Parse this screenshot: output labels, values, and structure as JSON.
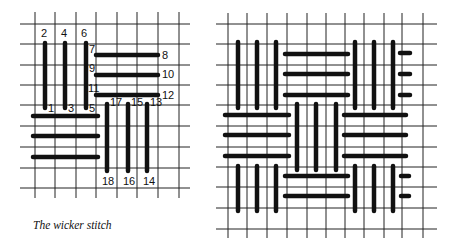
{
  "caption": "The wicker stitch",
  "left_figure": {
    "title": "stitch-order-diagram",
    "grid": {
      "x": [
        35,
        55,
        76,
        96,
        117,
        137,
        158,
        179
      ],
      "y": [
        24,
        44,
        65,
        85,
        105,
        126,
        147,
        168,
        188
      ],
      "x_extent": [
        20,
        190
      ],
      "y_extent": [
        12,
        198
      ]
    },
    "stitches": [
      {
        "x1": 45,
        "y1": 43,
        "x2": 45,
        "y2": 108
      },
      {
        "x1": 65,
        "y1": 43,
        "x2": 65,
        "y2": 108
      },
      {
        "x1": 86,
        "y1": 43,
        "x2": 86,
        "y2": 108
      },
      {
        "x1": 96,
        "y1": 55,
        "x2": 158,
        "y2": 55
      },
      {
        "x1": 96,
        "y1": 75,
        "x2": 158,
        "y2": 75
      },
      {
        "x1": 96,
        "y1": 95,
        "x2": 158,
        "y2": 95
      },
      {
        "x1": 33,
        "y1": 116,
        "x2": 98,
        "y2": 116
      },
      {
        "x1": 33,
        "y1": 136,
        "x2": 98,
        "y2": 136
      },
      {
        "x1": 33,
        "y1": 157,
        "x2": 98,
        "y2": 157
      },
      {
        "x1": 107,
        "y1": 104,
        "x2": 107,
        "y2": 171
      },
      {
        "x1": 128,
        "y1": 104,
        "x2": 128,
        "y2": 171
      },
      {
        "x1": 147,
        "y1": 104,
        "x2": 147,
        "y2": 171
      }
    ],
    "labels": [
      {
        "text": "2",
        "x": 41,
        "y": 37
      },
      {
        "text": "4",
        "x": 61,
        "y": 37
      },
      {
        "text": "6",
        "x": 81,
        "y": 37
      },
      {
        "text": "7",
        "x": 89,
        "y": 53
      },
      {
        "text": "8",
        "x": 162,
        "y": 59
      },
      {
        "text": "9",
        "x": 89,
        "y": 72
      },
      {
        "text": "10",
        "x": 162,
        "y": 78
      },
      {
        "text": "11",
        "x": 88,
        "y": 92
      },
      {
        "text": "12",
        "x": 162,
        "y": 99
      },
      {
        "text": "1",
        "x": 48,
        "y": 112
      },
      {
        "text": "3",
        "x": 68,
        "y": 112
      },
      {
        "text": "5",
        "x": 89,
        "y": 112
      },
      {
        "text": "17",
        "x": 110,
        "y": 106
      },
      {
        "text": "15",
        "x": 131,
        "y": 106
      },
      {
        "text": "13",
        "x": 150,
        "y": 106
      },
      {
        "text": "18",
        "x": 102,
        "y": 185
      },
      {
        "text": "16",
        "x": 123,
        "y": 185
      },
      {
        "text": "14",
        "x": 143,
        "y": 185
      }
    ]
  },
  "right_figure": {
    "title": "wicker-pattern-diagram",
    "grid": {
      "x": [
        228,
        247,
        267,
        287,
        307,
        326,
        345,
        364,
        384,
        402,
        423
      ],
      "y": [
        24,
        44,
        65,
        85,
        105,
        126,
        147,
        167,
        187,
        208,
        229
      ],
      "x_extent": [
        216,
        437
      ],
      "y_extent": [
        13,
        238
      ]
    },
    "stitches": [
      {
        "x1": 238,
        "y1": 42,
        "x2": 238,
        "y2": 108
      },
      {
        "x1": 257,
        "y1": 42,
        "x2": 257,
        "y2": 108
      },
      {
        "x1": 276,
        "y1": 42,
        "x2": 276,
        "y2": 108
      },
      {
        "x1": 285,
        "y1": 54,
        "x2": 348,
        "y2": 54
      },
      {
        "x1": 285,
        "y1": 74,
        "x2": 348,
        "y2": 74
      },
      {
        "x1": 285,
        "y1": 95,
        "x2": 348,
        "y2": 95
      },
      {
        "x1": 355,
        "y1": 42,
        "x2": 355,
        "y2": 108
      },
      {
        "x1": 374,
        "y1": 42,
        "x2": 374,
        "y2": 108
      },
      {
        "x1": 393,
        "y1": 42,
        "x2": 393,
        "y2": 108
      },
      {
        "x1": 400,
        "y1": 53,
        "x2": 410,
        "y2": 53
      },
      {
        "x1": 400,
        "y1": 74,
        "x2": 410,
        "y2": 74
      },
      {
        "x1": 400,
        "y1": 95,
        "x2": 410,
        "y2": 95
      },
      {
        "x1": 225,
        "y1": 115,
        "x2": 289,
        "y2": 115
      },
      {
        "x1": 225,
        "y1": 135,
        "x2": 289,
        "y2": 135
      },
      {
        "x1": 225,
        "y1": 156,
        "x2": 289,
        "y2": 156
      },
      {
        "x1": 297,
        "y1": 104,
        "x2": 297,
        "y2": 170
      },
      {
        "x1": 316,
        "y1": 104,
        "x2": 316,
        "y2": 170
      },
      {
        "x1": 336,
        "y1": 104,
        "x2": 336,
        "y2": 170
      },
      {
        "x1": 344,
        "y1": 115,
        "x2": 406,
        "y2": 115
      },
      {
        "x1": 344,
        "y1": 135,
        "x2": 406,
        "y2": 135
      },
      {
        "x1": 344,
        "y1": 156,
        "x2": 406,
        "y2": 156
      },
      {
        "x1": 238,
        "y1": 166,
        "x2": 238,
        "y2": 211
      },
      {
        "x1": 257,
        "y1": 166,
        "x2": 257,
        "y2": 211
      },
      {
        "x1": 276,
        "y1": 166,
        "x2": 276,
        "y2": 211
      },
      {
        "x1": 285,
        "y1": 176,
        "x2": 348,
        "y2": 176
      },
      {
        "x1": 285,
        "y1": 196,
        "x2": 348,
        "y2": 196
      },
      {
        "x1": 355,
        "y1": 166,
        "x2": 355,
        "y2": 211
      },
      {
        "x1": 374,
        "y1": 166,
        "x2": 374,
        "y2": 211
      },
      {
        "x1": 393,
        "y1": 166,
        "x2": 393,
        "y2": 211
      },
      {
        "x1": 401,
        "y1": 176,
        "x2": 409,
        "y2": 176
      },
      {
        "x1": 401,
        "y1": 196,
        "x2": 409,
        "y2": 196
      }
    ]
  }
}
